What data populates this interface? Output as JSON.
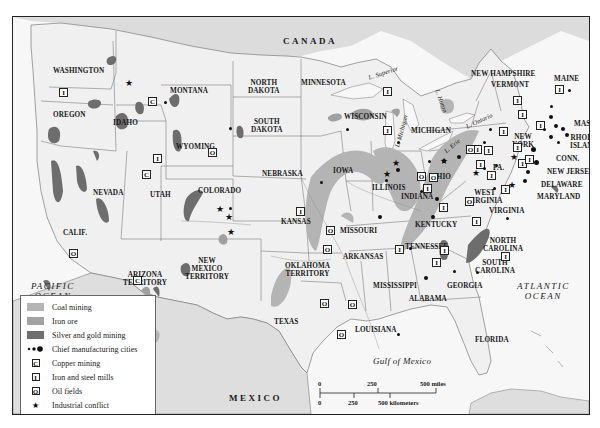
{
  "map": {
    "countries": {
      "canada": "CANADA",
      "mexico": "MEXICO"
    },
    "oceans": {
      "pacific": [
        "PACIFIC",
        "OCEAN"
      ],
      "atlantic": [
        "ATLANTIC",
        "OCEAN"
      ],
      "gulf": "Gulf of Mexico"
    },
    "lakes": {
      "superior": "L. Superior",
      "michigan": "L. Michigan",
      "huron": "L. Huron",
      "erie": "L. Erie",
      "ontario": "L. Ontario"
    },
    "states": {
      "washington": "WASHINGTON",
      "oregon": "OREGON",
      "idaho": "IDAHO",
      "montana": "MONTANA",
      "wyoming": "WYOMING",
      "north_dakota": [
        "NORTH",
        "DAKOTA"
      ],
      "south_dakota": [
        "SOUTH",
        "DAKOTA"
      ],
      "minnesota": "MINNESOTA",
      "wisconsin": "WISCONSIN",
      "michigan": "MICHIGAN",
      "nevada": "NEVADA",
      "utah": "UTAH",
      "colorado": "COLORADO",
      "california": "CALIF.",
      "nebraska": "NEBRASKA",
      "iowa": "IOWA",
      "illinois": "ILLINOIS",
      "indiana": "INDIANA",
      "ohio": "OHIO",
      "kansas": "KANSAS",
      "missouri": "MISSOURI",
      "kentucky": "KENTUCKY",
      "west_virginia": [
        "WEST",
        "VIRGINIA"
      ],
      "virginia": "VIRGINIA",
      "pennsylvania": "PA.",
      "new_york": [
        "NEW",
        "YORK"
      ],
      "new_hampshire": "NEW HAMPSHIRE",
      "vermont": "VERMONT",
      "maine": "MAINE",
      "massachusetts": "MASS.",
      "rhode_island": [
        "RHODE",
        "ISLAND"
      ],
      "connecticut": "CONN.",
      "new_jersey": "NEW JERSEY",
      "delaware": "DELAWARE",
      "maryland": "MARYLAND",
      "arizona": [
        "ARIZONA",
        "TERRITORY"
      ],
      "new_mexico": [
        "NEW",
        "MEXICO",
        "TERRITORY"
      ],
      "oklahoma": [
        "OKLAHOMA",
        "TERRITORY"
      ],
      "arkansas": "ARKANSAS",
      "tennessee": "TENNESSEE",
      "north_carolina": [
        "NORTH",
        "CAROLINA"
      ],
      "south_carolina": [
        "SOUTH",
        "CAROLINA"
      ],
      "mississippi": "MISSISSIPPI",
      "alabama": "ALABAMA",
      "georgia": "GEORGIA",
      "texas": "TEXAS",
      "louisiana": "LOUISIANA",
      "florida": "FLORIDA"
    },
    "symbols": {
      "copper": "C",
      "iron": "I",
      "oil": "O",
      "conflict": "★"
    }
  },
  "legend": {
    "items": [
      {
        "label": "Coal mining",
        "type": "swatch",
        "color": "#b4b4b4"
      },
      {
        "label": "Iron ore",
        "type": "swatch",
        "color": "#a2a2a2"
      },
      {
        "label": "Silver and gold mining",
        "type": "swatch",
        "color": "#6f6f6f"
      },
      {
        "label": "Chief manufacturing cities",
        "type": "dots"
      },
      {
        "label": "Copper mining",
        "type": "box",
        "glyph": "C"
      },
      {
        "label": "Iron and steel mills",
        "type": "box",
        "glyph": "I"
      },
      {
        "label": "Oil fields",
        "type": "box",
        "glyph": "O"
      },
      {
        "label": "Industrial conflict",
        "type": "star",
        "glyph": "★"
      }
    ]
  },
  "scale": {
    "miles": {
      "t0": "0",
      "t1": "250",
      "t2": "500 miles"
    },
    "km": {
      "t0": "0",
      "t1": "250",
      "t2": "500 kilometers"
    }
  },
  "colors": {
    "land": "#f1f1f1",
    "foreign_land": "#e2e2e2",
    "water": "#f8f8f8",
    "coal": "#b4b4b4",
    "iron_ore": "#a2a2a2",
    "silver_gold": "#6f6f6f",
    "border": "#555555"
  }
}
